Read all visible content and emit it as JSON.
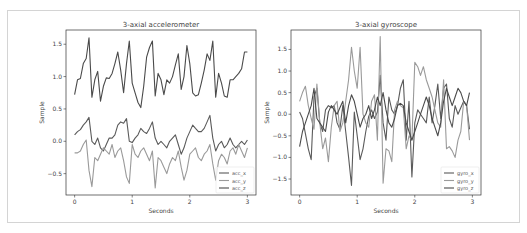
{
  "chart_data": [
    {
      "type": "line",
      "title": "3-axial accelerometer",
      "xlabel": "Seconds",
      "ylabel": "Sample",
      "xlim": [
        -0.15,
        3.15
      ],
      "ylim": [
        -0.83,
        1.72
      ],
      "xticks": [
        0,
        1,
        2,
        3
      ],
      "xtick_labels": [
        "0",
        "1",
        "2",
        "3"
      ],
      "yticks": [
        -0.5,
        0.0,
        0.5,
        1.0,
        1.5
      ],
      "ytick_labels": [
        "−0.5",
        "0.0",
        "0.5",
        "1.0",
        "1.5"
      ],
      "grid": false,
      "legend": "bottom-right",
      "series": [
        {
          "name": "acc_x",
          "color": "#5a5a5a",
          "x": [
            0,
            0.05,
            0.1,
            0.15,
            0.2,
            0.25,
            0.3,
            0.35,
            0.4,
            0.45,
            0.5,
            0.55,
            0.6,
            0.65,
            0.7,
            0.75,
            0.8,
            0.85,
            0.9,
            0.95,
            1.0,
            1.05,
            1.1,
            1.15,
            1.2,
            1.25,
            1.3,
            1.35,
            1.4,
            1.45,
            1.5,
            1.55,
            1.6,
            1.65,
            1.7,
            1.75,
            1.8,
            1.85,
            1.9,
            1.95,
            2.0,
            2.05,
            2.1,
            2.15,
            2.2,
            2.25,
            2.3,
            2.35,
            2.4,
            2.45,
            2.5,
            2.55,
            2.6,
            2.65,
            2.7,
            2.75,
            2.8,
            2.85,
            2.9,
            2.95,
            3.0
          ],
          "y": [
            0.1,
            0.15,
            0.18,
            0.25,
            0.3,
            0.37,
            0.0,
            -0.05,
            0.05,
            -0.1,
            -0.15,
            -0.05,
            0.05,
            0.05,
            0.1,
            0.25,
            0.3,
            0.28,
            0.35,
            0.0,
            -0.02,
            0.05,
            0.1,
            0.2,
            0.15,
            0.12,
            0.2,
            0.3,
            0.05,
            -0.05,
            0.0,
            -0.05,
            -0.1,
            0.0,
            0.05,
            0.1,
            -0.05,
            -0.2,
            -0.1,
            0.05,
            0.15,
            0.25,
            0.2,
            0.15,
            0.15,
            0.2,
            0.3,
            0.4,
            0.05,
            -0.15,
            -0.05,
            0.0,
            -0.1,
            -0.05,
            0.05,
            -0.05,
            -0.1,
            -0.05,
            0.0,
            -0.05,
            0.02
          ]
        },
        {
          "name": "acc_y",
          "color": "#9a9a9a",
          "x": [
            0,
            0.05,
            0.1,
            0.15,
            0.2,
            0.25,
            0.3,
            0.35,
            0.4,
            0.45,
            0.5,
            0.55,
            0.6,
            0.65,
            0.7,
            0.75,
            0.8,
            0.85,
            0.9,
            0.95,
            1.0,
            1.05,
            1.1,
            1.15,
            1.2,
            1.25,
            1.3,
            1.35,
            1.4,
            1.45,
            1.5,
            1.55,
            1.6,
            1.65,
            1.7,
            1.75,
            1.8,
            1.85,
            1.9,
            1.95,
            2.0,
            2.05,
            2.1,
            2.15,
            2.2,
            2.25,
            2.3,
            2.35,
            2.4,
            2.45,
            2.5,
            2.55,
            2.6,
            2.65,
            2.7,
            2.75,
            2.8,
            2.85,
            2.9,
            2.95,
            3.0
          ],
          "y": [
            -0.18,
            -0.18,
            -0.15,
            -0.05,
            0.02,
            -0.45,
            -0.7,
            -0.25,
            -0.3,
            -0.2,
            -0.1,
            -0.15,
            -0.2,
            -0.05,
            -0.25,
            -0.15,
            -0.1,
            -0.3,
            -0.55,
            -0.65,
            -0.05,
            -0.2,
            -0.25,
            -0.15,
            -0.1,
            -0.2,
            -0.3,
            -0.15,
            -0.72,
            -0.25,
            -0.3,
            -0.4,
            -0.5,
            -0.35,
            -0.25,
            -0.3,
            -0.15,
            -0.4,
            -0.6,
            -0.45,
            -0.2,
            -0.15,
            -0.1,
            -0.25,
            -0.3,
            -0.2,
            -0.15,
            -0.05,
            -0.35,
            -0.6,
            -0.3,
            -0.2,
            -0.25,
            -0.35,
            -0.15,
            -0.1,
            -0.2,
            -0.05,
            -0.15,
            -0.25,
            -0.1
          ]
        },
        {
          "name": "acc_z",
          "color": "#4a4a4a",
          "x": [
            0,
            0.05,
            0.1,
            0.15,
            0.2,
            0.25,
            0.3,
            0.35,
            0.4,
            0.45,
            0.5,
            0.55,
            0.6,
            0.65,
            0.7,
            0.75,
            0.8,
            0.85,
            0.9,
            0.95,
            1.0,
            1.05,
            1.1,
            1.15,
            1.2,
            1.25,
            1.3,
            1.35,
            1.4,
            1.45,
            1.5,
            1.55,
            1.6,
            1.65,
            1.7,
            1.75,
            1.8,
            1.85,
            1.9,
            1.95,
            2.0,
            2.05,
            2.1,
            2.15,
            2.2,
            2.25,
            2.3,
            2.35,
            2.4,
            2.45,
            2.5,
            2.55,
            2.6,
            2.65,
            2.7,
            2.75,
            2.8,
            2.85,
            2.9,
            2.95,
            3.0
          ],
          "y": [
            0.72,
            0.95,
            0.97,
            1.2,
            1.28,
            1.6,
            0.68,
            0.95,
            1.08,
            0.62,
            0.85,
            0.98,
            0.97,
            1.05,
            1.2,
            1.38,
            1.1,
            0.75,
            1.2,
            1.55,
            0.9,
            0.75,
            0.6,
            0.52,
            0.85,
            1.3,
            1.45,
            1.55,
            0.7,
            1.05,
            0.95,
            0.72,
            0.95,
            0.9,
            1.0,
            1.18,
            1.35,
            0.8,
            1.0,
            1.48,
            1.2,
            0.75,
            0.7,
            0.72,
            0.9,
            1.1,
            1.35,
            1.25,
            1.55,
            0.68,
            1.05,
            0.9,
            0.7,
            0.68,
            0.95,
            0.95,
            1.0,
            1.05,
            1.12,
            1.38,
            1.38
          ]
        }
      ]
    },
    {
      "type": "line",
      "title": "3-axial gyroscope",
      "xlabel": "Seconds",
      "ylabel": "Sample",
      "xlim": [
        -0.15,
        3.15
      ],
      "ylim": [
        -1.87,
        1.95
      ],
      "xticks": [
        0,
        1,
        2,
        3
      ],
      "xtick_labels": [
        "0",
        "1",
        "2",
        "3"
      ],
      "yticks": [
        -1.5,
        -1.0,
        -0.5,
        0.0,
        0.5,
        1.0,
        1.5
      ],
      "ytick_labels": [
        "−1.5",
        "−1.0",
        "−0.5",
        "0.0",
        "0.5",
        "1.0",
        "1.5"
      ],
      "grid": false,
      "legend": "bottom-right",
      "series": [
        {
          "name": "gyro_x",
          "color": "#5a5a5a",
          "x": [
            0,
            0.05,
            0.1,
            0.15,
            0.2,
            0.25,
            0.3,
            0.35,
            0.4,
            0.45,
            0.5,
            0.55,
            0.6,
            0.65,
            0.7,
            0.75,
            0.8,
            0.85,
            0.9,
            0.95,
            1.0,
            1.05,
            1.1,
            1.15,
            1.2,
            1.25,
            1.3,
            1.35,
            1.4,
            1.45,
            1.5,
            1.55,
            1.6,
            1.65,
            1.7,
            1.75,
            1.8,
            1.85,
            1.9,
            1.95,
            2.0,
            2.05,
            2.1,
            2.15,
            2.2,
            2.25,
            2.3,
            2.35,
            2.4,
            2.45,
            2.5,
            2.55,
            2.6,
            2.65,
            2.7,
            2.75,
            2.8,
            2.85,
            2.9,
            2.95
          ],
          "y": [
            0.05,
            -0.1,
            -0.45,
            -0.8,
            -1.05,
            0.4,
            0.6,
            -0.2,
            -0.4,
            0.1,
            0.2,
            0.15,
            0.2,
            -0.2,
            -0.35,
            0.2,
            -0.4,
            -1.0,
            -1.65,
            0.05,
            -0.5,
            -1.05,
            -0.8,
            -0.4,
            -0.05,
            0.1,
            -0.1,
            0.05,
            0.9,
            -0.2,
            -0.6,
            0.4,
            0.1,
            0.0,
            0.2,
            0.6,
            0.8,
            -0.6,
            0.3,
            -1.45,
            -0.2,
            0.1,
            0.0,
            -0.1,
            -0.2,
            0.4,
            -0.2,
            0.2,
            0.7,
            -0.1,
            0.6,
            0.7,
            -0.1,
            -0.3,
            0.2,
            0.0,
            0.15,
            0.3,
            0.2,
            -0.35
          ]
        },
        {
          "name": "gyro_y",
          "color": "#9a9a9a",
          "x": [
            0,
            0.05,
            0.1,
            0.15,
            0.2,
            0.25,
            0.3,
            0.35,
            0.4,
            0.45,
            0.5,
            0.55,
            0.6,
            0.65,
            0.7,
            0.75,
            0.8,
            0.85,
            0.9,
            0.95,
            1.0,
            1.05,
            1.1,
            1.15,
            1.2,
            1.25,
            1.3,
            1.35,
            1.4,
            1.45,
            1.5,
            1.55,
            1.6,
            1.65,
            1.7,
            1.75,
            1.8,
            1.85,
            1.9,
            1.95,
            2.0,
            2.05,
            2.1,
            2.15,
            2.2,
            2.25,
            2.3,
            2.35,
            2.4,
            2.45,
            2.5,
            2.55,
            2.6,
            2.65,
            2.7,
            2.75,
            2.8,
            2.85,
            2.9,
            2.95
          ],
          "y": [
            0.3,
            0.5,
            0.65,
            0.2,
            -0.1,
            -0.35,
            0.7,
            -0.2,
            -0.8,
            -0.55,
            -1.1,
            -0.3,
            0.2,
            0.3,
            -0.4,
            -0.2,
            0.3,
            0.8,
            1.55,
            1.0,
            0.6,
            1.55,
            0.0,
            -0.2,
            -0.3,
            0.3,
            0.45,
            -0.6,
            1.8,
            -1.6,
            -0.8,
            -0.85,
            -1.1,
            0.1,
            0.3,
            0.2,
            0.15,
            -0.8,
            -0.5,
            -0.6,
            1.2,
            1.1,
            0.9,
            1.1,
            0.8,
            0.6,
            0.4,
            0.1,
            -0.2,
            -0.3,
            0.8,
            -0.8,
            -0.75,
            -0.85,
            -1.0,
            -0.6,
            -0.4,
            0.3,
            0.2,
            -0.6
          ]
        },
        {
          "name": "gyro_z",
          "color": "#4a4a4a",
          "x": [
            0,
            0.05,
            0.1,
            0.15,
            0.2,
            0.25,
            0.3,
            0.35,
            0.4,
            0.45,
            0.5,
            0.55,
            0.6,
            0.65,
            0.7,
            0.75,
            0.8,
            0.85,
            0.9,
            0.95,
            1.0,
            1.05,
            1.1,
            1.15,
            1.2,
            1.25,
            1.3,
            1.35,
            1.4,
            1.45,
            1.5,
            1.55,
            1.6,
            1.65,
            1.7,
            1.75,
            1.8,
            1.85,
            1.9,
            1.95,
            2.0,
            2.05,
            2.1,
            2.15,
            2.2,
            2.25,
            2.3,
            2.35,
            2.4,
            2.45,
            2.5,
            2.55,
            2.6,
            2.65,
            2.7,
            2.75,
            2.8,
            2.85,
            2.9,
            2.95
          ],
          "y": [
            -0.75,
            -0.4,
            -0.2,
            0.0,
            0.2,
            0.6,
            -0.1,
            -0.2,
            -0.3,
            -0.4,
            0.05,
            0.2,
            0.1,
            0.0,
            0.15,
            0.3,
            -0.2,
            0.2,
            0.45,
            0.3,
            0.0,
            -0.3,
            -0.1,
            0.0,
            0.2,
            -0.1,
            0.1,
            0.4,
            0.2,
            0.5,
            0.1,
            -0.2,
            -0.3,
            -0.1,
            0.2,
            0.25,
            0.2,
            -0.2,
            -0.4,
            -0.6,
            -0.4,
            -0.2,
            0.0,
            0.2,
            0.4,
            0.2,
            -0.1,
            -0.3,
            -0.5,
            -0.2,
            0.3,
            0.6,
            0.4,
            0.2,
            0.4,
            0.6,
            0.5,
            0.3,
            0.2,
            0.5
          ]
        }
      ]
    }
  ]
}
